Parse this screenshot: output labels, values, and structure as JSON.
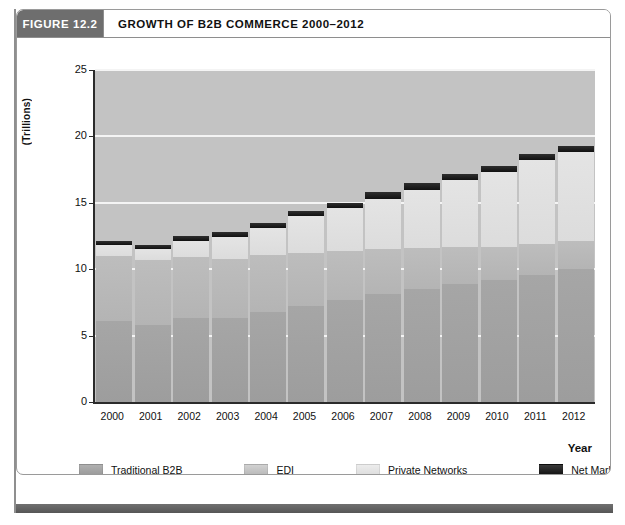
{
  "figure": {
    "number_label": "FIGURE 12.2",
    "title": "GROWTH OF B2B COMMERCE 2000–2012"
  },
  "axes": {
    "y_title": "(Trillions)",
    "x_title": "Year",
    "y_ticks": [
      "0",
      "5",
      "10",
      "15",
      "20",
      "25"
    ],
    "x_ticks": [
      "2000",
      "2001",
      "2002",
      "2003",
      "2004",
      "2005",
      "2006",
      "2007",
      "2008",
      "2009",
      "2010",
      "2011",
      "2012"
    ]
  },
  "legend": {
    "items": [
      {
        "label": "Traditional B2B",
        "color": "#a0a0a0"
      },
      {
        "label": "EDI",
        "color": "#b8b8b8"
      },
      {
        "label": "Private Networks",
        "color": "#e0e0e0"
      },
      {
        "label": "Net Markets",
        "color": "#151515"
      }
    ]
  },
  "chart_data": {
    "type": "bar",
    "title": "GROWTH OF B2B COMMERCE 2000–2012",
    "subtitle": "",
    "xlabel": "Year",
    "ylabel": "(Trillions)",
    "ylim": [
      0,
      25
    ],
    "grid": true,
    "stacked": true,
    "legend_position": "bottom",
    "categories": [
      "2000",
      "2001",
      "2002",
      "2003",
      "2004",
      "2005",
      "2006",
      "2007",
      "2008",
      "2009",
      "2010",
      "2011",
      "2012"
    ],
    "series": [
      {
        "name": "Traditional B2B",
        "color": "#a0a0a0",
        "values": [
          6.1,
          5.8,
          6.3,
          6.3,
          6.8,
          7.2,
          7.7,
          8.1,
          8.5,
          8.9,
          9.2,
          9.6,
          10.0
        ]
      },
      {
        "name": "EDI",
        "color": "#b8b8b8",
        "values": [
          4.9,
          4.9,
          4.6,
          4.5,
          4.3,
          4.0,
          3.7,
          3.4,
          3.1,
          2.8,
          2.5,
          2.3,
          2.1
        ]
      },
      {
        "name": "Private Networks",
        "color": "#e0e0e0",
        "values": [
          0.8,
          0.8,
          1.2,
          1.6,
          2.0,
          2.8,
          3.2,
          3.8,
          4.4,
          5.0,
          5.6,
          6.3,
          6.7
        ]
      },
      {
        "name": "Net Markets",
        "color": "#151515",
        "values": [
          0.3,
          0.3,
          0.4,
          0.4,
          0.4,
          0.4,
          0.4,
          0.5,
          0.5,
          0.5,
          0.5,
          0.5,
          0.5
        ]
      }
    ],
    "totals": [
      12.1,
      11.8,
      12.5,
      12.8,
      13.5,
      14.4,
      15.0,
      15.8,
      16.5,
      17.2,
      17.8,
      18.7,
      19.3
    ]
  }
}
